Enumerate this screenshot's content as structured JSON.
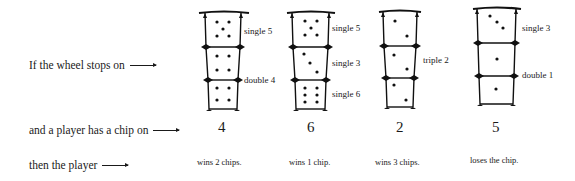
{
  "rows": {
    "wheel_label": "If the wheel stops on",
    "chip_label": "and a player has a chip on",
    "result_label": "then the player"
  },
  "arrow_icon": "right-arrow-icon",
  "examples": [
    {
      "dice": [
        {
          "pips": 5,
          "label": "single 5"
        },
        {
          "pips": 4,
          "label": ""
        },
        {
          "pips": 4,
          "label": "double 4"
        }
      ],
      "labels": [
        "single 5",
        "double 4"
      ],
      "chip_number": "4",
      "outcome": "wins 2 chips."
    },
    {
      "dice": [
        {
          "pips": 5,
          "label": "single 5"
        },
        {
          "pips": 3,
          "label": "single 3"
        },
        {
          "pips": 6,
          "label": "single 6"
        }
      ],
      "labels": [
        "single 5",
        "single 3",
        "single 6"
      ],
      "chip_number": "6",
      "outcome": "wins 1 chip."
    },
    {
      "dice": [
        {
          "pips": 2,
          "label": ""
        },
        {
          "pips": 2,
          "label": "triple 2"
        },
        {
          "pips": 2,
          "label": ""
        }
      ],
      "labels": [
        "triple 2"
      ],
      "chip_number": "2",
      "outcome": "wins 3 chips."
    },
    {
      "dice": [
        {
          "pips": 3,
          "label": "single 3"
        },
        {
          "pips": 1,
          "label": ""
        },
        {
          "pips": 1,
          "label": "double 1"
        }
      ],
      "labels": [
        "single 3",
        "double 1"
      ],
      "chip_number": "5",
      "outcome": "loses the chip."
    }
  ]
}
